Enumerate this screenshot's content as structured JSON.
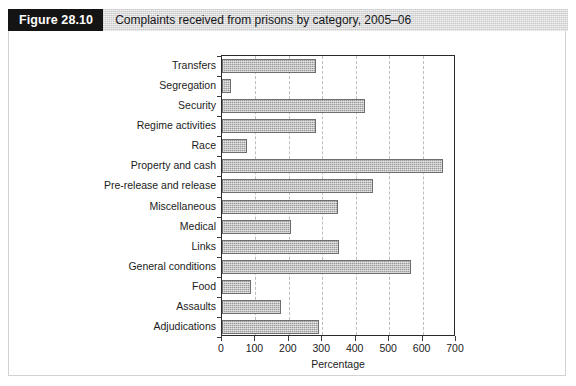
{
  "header": {
    "figure_tag": "Figure 28.10",
    "title": "Complaints received from prisons by category, 2005–06"
  },
  "chart_data": {
    "type": "bar",
    "orientation": "horizontal",
    "title": "Complaints received from prisons by category, 2005–06",
    "xlabel": "Percentage",
    "ylabel": "",
    "xlim": [
      0,
      700
    ],
    "xticks": [
      0,
      100,
      200,
      300,
      400,
      500,
      600,
      700
    ],
    "xtick_labels": [
      "0",
      "100",
      "200",
      "300",
      "400",
      "500",
      "600",
      "700"
    ],
    "grid": "vertical-dashed",
    "legend": "none",
    "bar_color": "#9a9a9a",
    "bar_edge_color": "#6e6e6e",
    "categories": [
      "Transfers",
      "Segregation",
      "Security",
      "Regime activities",
      "Race",
      "Property and cash",
      "Pre-release and release",
      "Miscellaneous",
      "Medical",
      "Links",
      "General conditions",
      "Food",
      "Assaults",
      "Adjudications"
    ],
    "values": [
      281,
      27,
      428,
      281,
      75,
      662,
      452,
      347,
      207,
      350,
      566,
      87,
      177,
      290
    ]
  }
}
